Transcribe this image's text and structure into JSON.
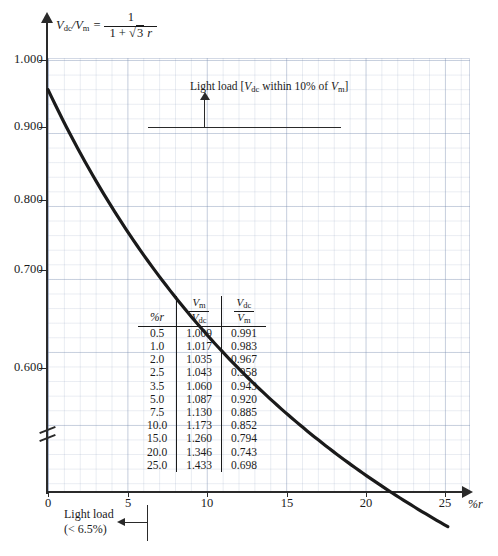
{
  "chart_data": {
    "type": "line",
    "xlabel": "%r",
    "ylabel": "Vdc/Vm",
    "xlim": [
      0,
      28.5
    ],
    "ylim": [
      0.555,
      1.035
    ],
    "grid": true,
    "legend": "none",
    "x_ticks": [
      "0",
      "5",
      "10",
      "15",
      "20",
      "25"
    ],
    "x_tick_values": [
      0,
      5,
      10,
      15,
      20,
      25
    ],
    "y_ticks": [
      "1.000",
      "0.900",
      "0.800",
      "0.700",
      "0.600"
    ],
    "y_tick_values": [
      1.0,
      0.9,
      0.8,
      0.7,
      0.6
    ],
    "y_axis_break": true,
    "series": [
      {
        "name": "Vdc/Vm",
        "x": [
          0,
          0.5,
          1.0,
          2.0,
          2.5,
          3.5,
          5.0,
          7.5,
          10.0,
          15.0,
          20.0,
          25.0,
          27.2
        ],
        "values": [
          0.995,
          0.991,
          0.983,
          0.967,
          0.958,
          0.943,
          0.92,
          0.885,
          0.852,
          0.794,
          0.743,
          0.698,
          0.698
        ]
      }
    ],
    "annotations": [
      "Light load [Vdc within 10% of Vm]",
      "Light load (< 6.5%)"
    ]
  },
  "formula": {
    "lhs_v": "V",
    "lhs_sub1": "dc",
    "lhs_slash": "/V",
    "lhs_sub2": "m",
    "equals": "=",
    "numerator": "1",
    "denominator_pre": "1 +",
    "denominator_root": "√3",
    "denominator_r": "r"
  },
  "axes": {
    "y_labels": [
      "1.000",
      "0.900",
      "0.800",
      "0.700",
      "0.600"
    ],
    "x_labels": [
      "0",
      "5",
      "10",
      "15",
      "20",
      "25"
    ],
    "x_axis_name": "%r"
  },
  "annotation_top": {
    "text_pre": "Light load [",
    "v1": "V",
    "v1_sub": "dc",
    "text_mid": " within 10% of ",
    "v2": "V",
    "v2_sub": "m",
    "text_end": "]"
  },
  "annotation_bottom": {
    "line1": "Light load",
    "line2": "(< 6.5%)"
  },
  "table": {
    "header": {
      "col1": "%r",
      "col2_num": "V",
      "col2_num_sub": "m",
      "col2_den": "V",
      "col2_den_sub": "dc",
      "col3_num": "V",
      "col3_num_sub": "dc",
      "col3_den": "V",
      "col3_den_sub": "m"
    },
    "rows": [
      {
        "r": "0.5",
        "vm_vdc": "1.009",
        "vdc_vm": "0.991"
      },
      {
        "r": "1.0",
        "vm_vdc": "1.017",
        "vdc_vm": "0.983"
      },
      {
        "r": "2.0",
        "vm_vdc": "1.035",
        "vdc_vm": "0.967"
      },
      {
        "r": "2.5",
        "vm_vdc": "1.043",
        "vdc_vm": "0.958"
      },
      {
        "r": "3.5",
        "vm_vdc": "1.060",
        "vdc_vm": "0.943"
      },
      {
        "r": "5.0",
        "vm_vdc": "1.087",
        "vdc_vm": "0.920"
      },
      {
        "r": "7.5",
        "vm_vdc": "1.130",
        "vdc_vm": "0.885"
      },
      {
        "r": "10.0",
        "vm_vdc": "1.173",
        "vdc_vm": "0.852"
      },
      {
        "r": "15.0",
        "vm_vdc": "1.260",
        "vdc_vm": "0.794"
      },
      {
        "r": "20.0",
        "vm_vdc": "1.346",
        "vdc_vm": "0.743"
      },
      {
        "r": "25.0",
        "vm_vdc": "1.433",
        "vdc_vm": "0.698"
      }
    ]
  },
  "colors": {
    "curve": "#1a1a1a",
    "grid": "#8494ae",
    "axis": "#2a2a2a",
    "background": "#ffffff"
  }
}
